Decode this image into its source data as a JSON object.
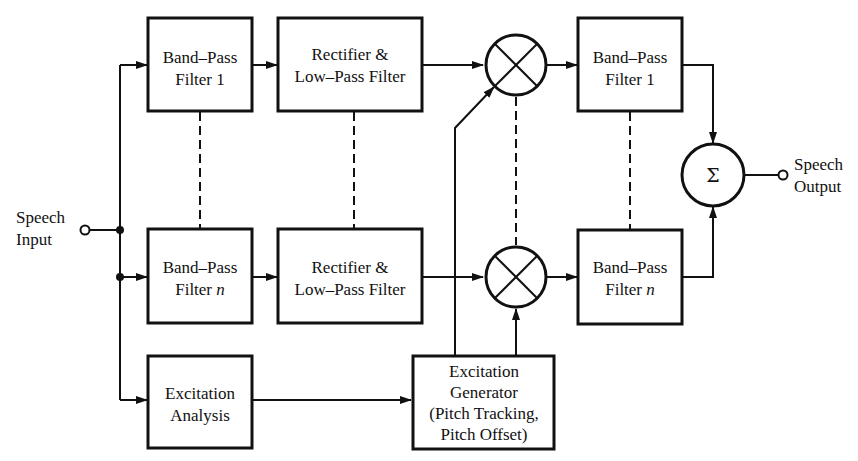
{
  "diagram": {
    "input": {
      "label_line1": "Speech",
      "label_line2": "Input"
    },
    "output": {
      "label_line1": "Speech",
      "label_line2": "Output"
    },
    "analysis_bank": {
      "bpf_1": {
        "line1": "Band–Pass",
        "line2": "Filter 1"
      },
      "bpf_n": {
        "line1": "Band–Pass",
        "line2_prefix": "Filter ",
        "line2_var": "n"
      },
      "rect_1": {
        "line1": "Rectifier &",
        "line2": "Low–Pass Filter"
      },
      "rect_n": {
        "line1": "Rectifier &",
        "line2": "Low–Pass Filter"
      }
    },
    "excitation_analysis": {
      "line1": "Excitation",
      "line2": "Analysis"
    },
    "excitation_generator": {
      "line1": "Excitation",
      "line2": "Generator",
      "line3": "(Pitch Tracking,",
      "line4": "Pitch Offset)"
    },
    "synthesis_bank": {
      "bpf_1": {
        "line1": "Band–Pass",
        "line2": "Filter 1"
      },
      "bpf_n": {
        "line1": "Band–Pass",
        "line2_prefix": "Filter ",
        "line2_var": "n"
      }
    },
    "multiplier_symbol": "×",
    "summer": {
      "symbol": "Σ"
    },
    "colors": {
      "ink": "#111111",
      "background": "#ffffff"
    }
  }
}
